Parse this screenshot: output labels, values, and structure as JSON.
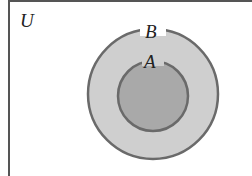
{
  "diagram": {
    "type": "venn",
    "universe_label": "U",
    "sets": [
      {
        "label": "B",
        "contains": [
          "A"
        ],
        "fill": "#cfcfcf"
      },
      {
        "label": "A",
        "contained_in": "B",
        "fill": "#a9a9a9"
      }
    ],
    "stroke_color": "#6a6a6a"
  }
}
